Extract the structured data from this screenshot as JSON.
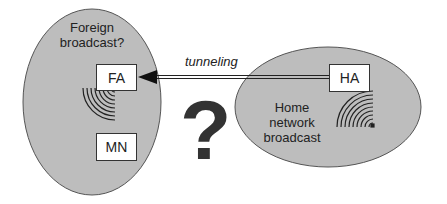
{
  "diagram": {
    "foreign_network": {
      "label": "Foreign broadcast?",
      "label_line1": "Foreign",
      "label_line2": "broadcast?",
      "nodes": {
        "fa": "FA",
        "mn": "MN"
      }
    },
    "home_network": {
      "label": "Home network broadcast",
      "label_line1": "Home",
      "label_line2": "network",
      "label_line3": "broadcast",
      "nodes": {
        "ha": "HA"
      }
    },
    "link": {
      "label": "tunneling",
      "from": "HA",
      "to": "FA"
    },
    "question_mark": "?",
    "colors": {
      "ellipse_fill": "#bdbdbd",
      "ellipse_stroke": "#555555",
      "box_fill": "#ffffff",
      "line": "#222222",
      "question_mark": "#333333"
    }
  }
}
